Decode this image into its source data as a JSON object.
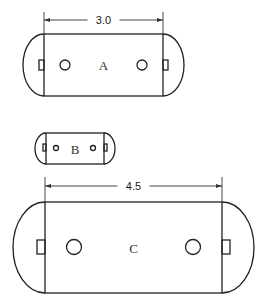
{
  "diagram": {
    "shapes": [
      {
        "id": "A",
        "label": "A",
        "dimension": "3.0",
        "rect": {
          "x1": 44,
          "x2": 163,
          "y1": 34,
          "y2": 96
        },
        "arc_extent": {
          "left": 23,
          "right": 184
        },
        "holes": [
          {
            "cx": 65,
            "cy": 65,
            "r": 5
          },
          {
            "cx": 142,
            "cy": 65,
            "r": 5
          }
        ],
        "tabs": [
          {
            "x": 39,
            "y": 60,
            "w": 5,
            "h": 10
          },
          {
            "x": 163,
            "y": 60,
            "w": 5,
            "h": 10
          }
        ],
        "dim_y": 20,
        "ext_top": 12
      },
      {
        "id": "B",
        "label": "B",
        "dimension": null,
        "rect": {
          "x1": 46,
          "x2": 104,
          "y1": 133,
          "y2": 164
        },
        "arc_extent": {
          "left": 35,
          "right": 115
        },
        "holes": [
          {
            "cx": 56,
            "cy": 148,
            "r": 2.5
          },
          {
            "cx": 93,
            "cy": 148,
            "r": 2.5
          }
        ],
        "tabs": [
          {
            "x": 43,
            "y": 144,
            "w": 3,
            "h": 7
          },
          {
            "x": 104,
            "y": 144,
            "w": 3,
            "h": 7
          }
        ]
      },
      {
        "id": "C",
        "label": "C",
        "dimension": "4.5",
        "rect": {
          "x1": 45,
          "x2": 222,
          "y1": 202,
          "y2": 293
        },
        "arc_extent": {
          "left": 13,
          "right": 254
        },
        "holes": [
          {
            "cx": 74,
            "cy": 247,
            "r": 7.5
          },
          {
            "cx": 193,
            "cy": 247,
            "r": 7.5
          }
        ],
        "tabs": [
          {
            "x": 37,
            "y": 240,
            "w": 8,
            "h": 14
          },
          {
            "x": 222,
            "y": 240,
            "w": 8,
            "h": 14
          }
        ],
        "dim_y": 186,
        "ext_top": 177
      }
    ]
  }
}
